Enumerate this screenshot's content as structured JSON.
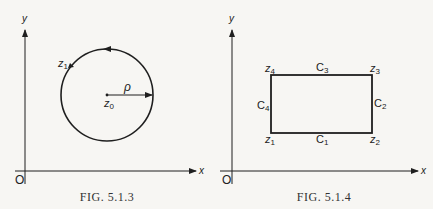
{
  "figures": [
    {
      "id": "fig-5-1-3",
      "caption": "FIG. 5.1.3",
      "axes": {
        "x_label": "x",
        "y_label": "y",
        "origin_label": "O"
      },
      "circle": {
        "center_label": "z0",
        "radius_label": "ρ",
        "point_label": "z1",
        "orientation": "counterclockwise"
      }
    },
    {
      "id": "fig-5-1-4",
      "caption": "FIG. 5.1.4",
      "axes": {
        "x_label": "x",
        "y_label": "y",
        "origin_label": "O"
      },
      "rectangle": {
        "vertices": [
          "z1",
          "z2",
          "z3",
          "z4"
        ],
        "sides": [
          "C1",
          "C2",
          "C3",
          "C4"
        ]
      }
    }
  ],
  "colors": {
    "ink": "#1f1f1f",
    "background": "#f7f6f3"
  }
}
